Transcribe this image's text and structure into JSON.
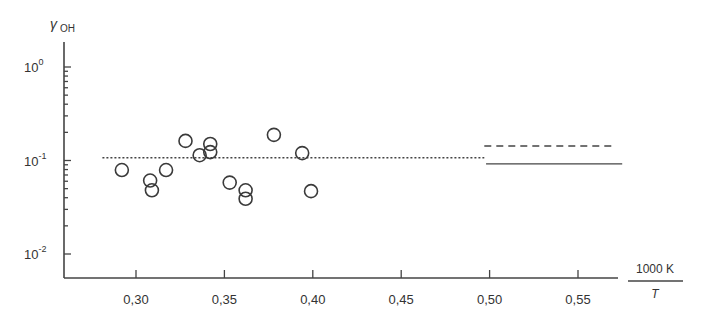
{
  "chart_data": {
    "type": "scatter",
    "title": "",
    "xlabel": "1000 K / T",
    "xlabel_numerator": "1000 K",
    "xlabel_denominator": "T",
    "ylabel": "γOH",
    "ylabel_main": "γ",
    "ylabel_sub": "OH",
    "yscale": "log",
    "xlim": [
      0.263,
      0.575
    ],
    "ylim": [
      0.0065,
      1.8
    ],
    "grid": false,
    "x_ticks": [
      0.3,
      0.35,
      0.4,
      0.45,
      0.5,
      0.55
    ],
    "x_tick_labels": [
      "0,30",
      "0,35",
      "0,40",
      "0,45",
      "0,50",
      "0,55"
    ],
    "y_major_ticks": [
      1,
      0.1,
      0.01
    ],
    "y_tick_labels": [
      {
        "base": "10",
        "exp": "0"
      },
      {
        "base": "10",
        "exp": "-1"
      },
      {
        "base": "10",
        "exp": "-2"
      }
    ],
    "series": [
      {
        "name": "measurements",
        "style": "open-circle",
        "points": [
          {
            "x": 0.292,
            "y": 0.079
          },
          {
            "x": 0.308,
            "y": 0.061
          },
          {
            "x": 0.309,
            "y": 0.048
          },
          {
            "x": 0.317,
            "y": 0.079
          },
          {
            "x": 0.328,
            "y": 0.162
          },
          {
            "x": 0.336,
            "y": 0.114
          },
          {
            "x": 0.342,
            "y": 0.15
          },
          {
            "x": 0.342,
            "y": 0.123
          },
          {
            "x": 0.353,
            "y": 0.058
          },
          {
            "x": 0.362,
            "y": 0.048
          },
          {
            "x": 0.362,
            "y": 0.039
          },
          {
            "x": 0.378,
            "y": 0.188
          },
          {
            "x": 0.394,
            "y": 0.12
          },
          {
            "x": 0.399,
            "y": 0.047
          }
        ]
      },
      {
        "name": "mean (dotted)",
        "style": "dotted",
        "x": [
          0.281,
          0.497
        ],
        "y": [
          0.107,
          0.107
        ]
      },
      {
        "name": "upper (dashed)",
        "style": "dashed",
        "x": [
          0.497,
          0.57
        ],
        "y": [
          0.143,
          0.143
        ]
      },
      {
        "name": "lower (solid)",
        "style": "solid",
        "x": [
          0.498,
          0.575
        ],
        "y": [
          0.092,
          0.092
        ]
      }
    ],
    "legend": null,
    "colors": {
      "ink": "#444444",
      "background": "#ffffff"
    }
  }
}
